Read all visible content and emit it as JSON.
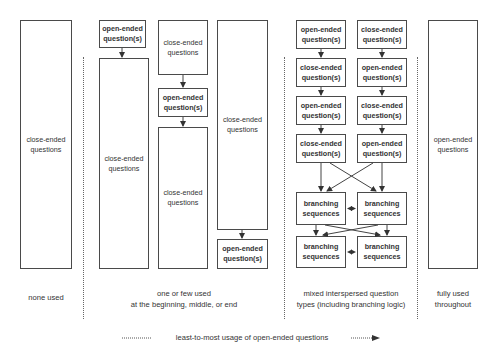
{
  "columns": [
    {
      "id": "none",
      "label": "none used",
      "boxes": [
        {
          "text": "close-ended\nquestions",
          "kind": "close"
        }
      ]
    },
    {
      "id": "one-or-few",
      "label": "one or few used\nat the beginning, middle, or end",
      "variants": [
        {
          "position": "beginning",
          "boxes": [
            {
              "text": "open-ended\nquestion(s)",
              "kind": "open"
            },
            {
              "text": "close-ended\nquestions",
              "kind": "close"
            }
          ]
        },
        {
          "position": "middle",
          "boxes": [
            {
              "text": "close-ended\nquestions",
              "kind": "close"
            },
            {
              "text": "open-ended\nquestion(s)",
              "kind": "open"
            },
            {
              "text": "close-ended\nquestions",
              "kind": "close"
            }
          ]
        },
        {
          "position": "end",
          "boxes": [
            {
              "text": "close-ended\nquestions",
              "kind": "close"
            },
            {
              "text": "open-ended\nquestion(s)",
              "kind": "open"
            }
          ]
        }
      ]
    },
    {
      "id": "mixed",
      "label": "mixed interspersed question\ntypes (including branching logic)",
      "left_stack": [
        {
          "text": "open-ended\nquestion(s)",
          "kind": "open"
        },
        {
          "text": "close-ended\nquestion(s)",
          "kind": "close"
        },
        {
          "text": "open-ended\nquestion(s)",
          "kind": "open"
        },
        {
          "text": "close-ended\nquestion(s)",
          "kind": "close"
        }
      ],
      "right_stack": [
        {
          "text": "close-ended\nquestion(s)",
          "kind": "close"
        },
        {
          "text": "open-ended\nquestion(s)",
          "kind": "open"
        },
        {
          "text": "close-ended\nquestion(s)",
          "kind": "close"
        },
        {
          "text": "open-ended\nquestion(s)",
          "kind": "open"
        }
      ],
      "branching": [
        {
          "text": "branching\nsequences"
        },
        {
          "text": "branching\nsequences"
        },
        {
          "text": "branching\nsequences"
        },
        {
          "text": "branching\nsequences"
        }
      ]
    },
    {
      "id": "fully",
      "label": "fully used\nthroughout",
      "boxes": [
        {
          "text": "open-ended\nquestions",
          "kind": "open"
        }
      ]
    }
  ],
  "footer": {
    "axis_label": "least-to-most usage of open-ended questions"
  },
  "colors": {
    "border": "#4a4a4a",
    "text": "#333333",
    "divider": "#666666"
  }
}
